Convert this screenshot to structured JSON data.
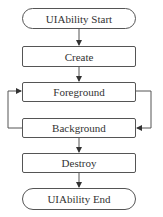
{
  "diagram": {
    "type": "flowchart",
    "nodes": [
      {
        "id": "start",
        "label": "UIAbility Start",
        "shape": "terminal"
      },
      {
        "id": "create",
        "label": "Create",
        "shape": "process"
      },
      {
        "id": "foreground",
        "label": "Foreground",
        "shape": "process"
      },
      {
        "id": "background",
        "label": "Background",
        "shape": "process"
      },
      {
        "id": "destroy",
        "label": "Destroy",
        "shape": "process"
      },
      {
        "id": "end",
        "label": "UIAbility End",
        "shape": "terminal"
      }
    ],
    "edges": [
      {
        "from": "start",
        "to": "create"
      },
      {
        "from": "create",
        "to": "foreground"
      },
      {
        "from": "foreground",
        "to": "background"
      },
      {
        "from": "background",
        "to": "foreground"
      },
      {
        "from": "background",
        "to": "destroy"
      },
      {
        "from": "destroy",
        "to": "end"
      }
    ],
    "colors": {
      "stroke": "#555555",
      "text": "#333333",
      "background": "#ffffff"
    }
  }
}
